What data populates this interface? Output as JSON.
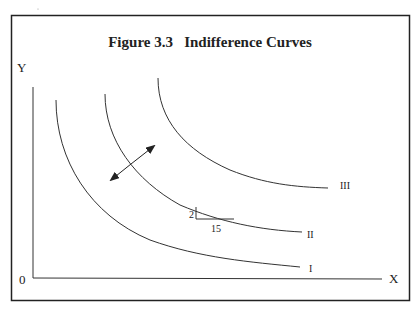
{
  "figure": {
    "title": "Figure 3.3   Indifference Curves",
    "colors": {
      "line": "#333333",
      "frame": "#222222",
      "background": "#ffffff"
    }
  },
  "axes": {
    "y_label": "Y",
    "x_label": "X",
    "origin_label": "0"
  },
  "curves": [
    {
      "id": "I",
      "label": "I"
    },
    {
      "id": "II",
      "label": "II"
    },
    {
      "id": "III",
      "label": "III"
    }
  ],
  "slope_triangle": {
    "rise_label": "2",
    "run_label": "15"
  },
  "annotations": {
    "double_arrow": "bidirectional arrow perpendicular to curve II indicating direction of higher/lower utility"
  }
}
